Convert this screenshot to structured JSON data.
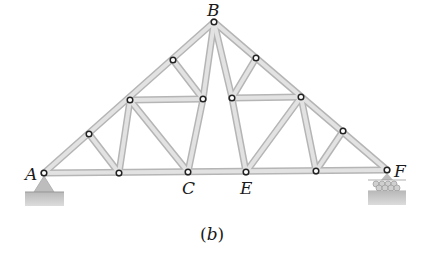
{
  "diagram": {
    "type": "roof truss",
    "caption": {
      "open": "(",
      "letter": "b",
      "close": ")"
    },
    "labels": {
      "A": "A",
      "B": "B",
      "C": "C",
      "E": "E",
      "F": "F"
    },
    "supports": {
      "left": "pin support at A",
      "right": "roller support at F"
    },
    "colors": {
      "member_fill": "#d9d9d9",
      "member_edge": "#b3b3b3",
      "support": "#bdbdbd",
      "ground": "#c4c4c4",
      "node_stroke": "#222222"
    }
  }
}
